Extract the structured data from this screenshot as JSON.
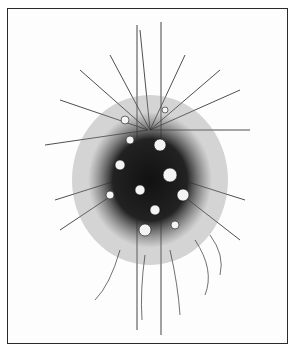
{
  "image": {
    "description": "Pen-and-ink illustration of a hanging floral arrangement (bouquet of flowers with trailing sprigs and vines) suspended by two vertical cords inside a rectangular frame",
    "colors": {
      "background": "#ffffff",
      "ink": "#1a1a1a",
      "frame": "#2a2a2a"
    }
  }
}
